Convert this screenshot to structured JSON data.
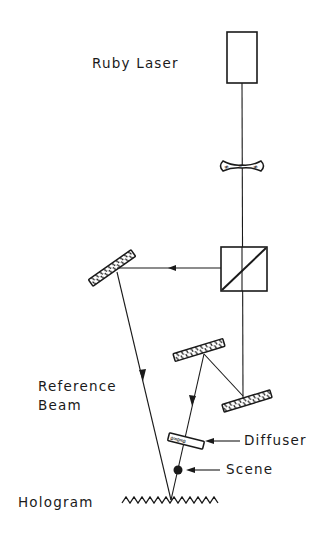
{
  "diagram": {
    "type": "optical-setup",
    "labels": {
      "laser": "Ruby Laser",
      "reference_line1": "Reference",
      "reference_line2": "Beam",
      "diffuser": "Diffuser",
      "scene": "Scene",
      "hologram": "Hologram"
    },
    "components": [
      {
        "id": "ruby-laser",
        "kind": "laser"
      },
      {
        "id": "beam-expander",
        "kind": "lens"
      },
      {
        "id": "beam-splitter",
        "kind": "beamsplitter"
      },
      {
        "id": "reference-mirror",
        "kind": "mirror"
      },
      {
        "id": "object-mirror-1",
        "kind": "mirror"
      },
      {
        "id": "object-mirror-2",
        "kind": "mirror"
      },
      {
        "id": "diffuser",
        "kind": "diffuser"
      },
      {
        "id": "scene",
        "kind": "object"
      },
      {
        "id": "hologram",
        "kind": "film"
      }
    ],
    "colors": {
      "ink": "#1a1a1a",
      "background": "#ffffff"
    }
  }
}
